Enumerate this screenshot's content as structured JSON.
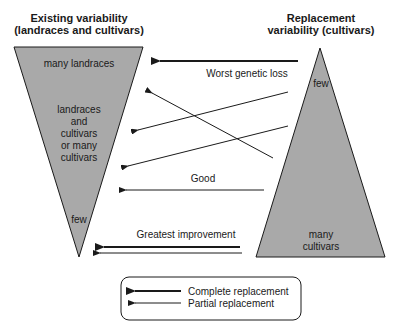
{
  "left": {
    "title_line1": "Existing variability",
    "title_line2": "(landraces and cultivars)",
    "labels": {
      "top": "many landraces",
      "mid1": "landraces",
      "mid2": "and",
      "mid3": "cultivars",
      "mid4": "or many",
      "mid5": "cultivars",
      "bottom": "few"
    }
  },
  "right": {
    "title_line1": "Replacement",
    "title_line2": "variability (cultivars)",
    "labels": {
      "top": "few",
      "bottom1": "many",
      "bottom2": "cultivars"
    }
  },
  "arrows": {
    "worst": "Worst genetic loss",
    "good": "Good",
    "greatest": "Greatest improvement"
  },
  "legend": {
    "complete": "Complete replacement",
    "partial": "Partial replacement"
  },
  "colors": {
    "triangle_fill": "#a9a9a9",
    "line": "#1a1a1a"
  }
}
